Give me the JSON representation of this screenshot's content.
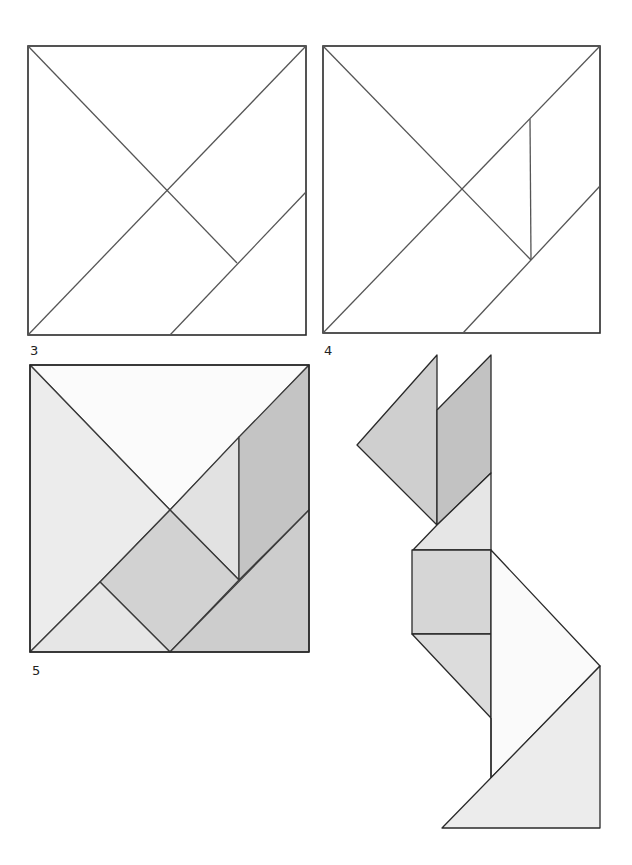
{
  "figures": [
    {
      "id": "fig3",
      "label": "3",
      "description": "Tangram square divided into 5 pieces"
    },
    {
      "id": "fig4",
      "label": "4",
      "description": "Tangram square divided into 6 pieces"
    },
    {
      "id": "fig5",
      "label": "5",
      "description": "Tangram square fully divided into 7 shaded pieces"
    },
    {
      "id": "rabbit",
      "label": "",
      "description": "Rabbit figure assembled from the 7 tangram pieces"
    }
  ],
  "colors": {
    "stroke": "#2a2a2a",
    "stroke_light": "#555555",
    "fill_white": "#ffffff",
    "fill_lightest": "#f1f1f1",
    "fill_light": "#e4e4e4",
    "fill_mid": "#d4d4d4",
    "fill_dark": "#bdbdbd"
  }
}
